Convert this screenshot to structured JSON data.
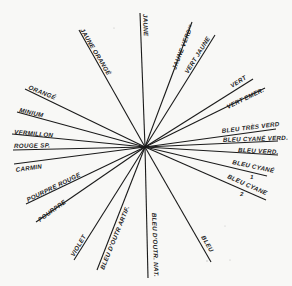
{
  "diagram": {
    "title": "",
    "center": {
      "x": 145,
      "y": 147
    },
    "rays": [
      {
        "label": "JAUNE",
        "x": 140,
        "y": 13
      },
      {
        "label": "JAUNE VERDʳᵉ",
        "x": 192,
        "y": 22
      },
      {
        "label": "VERT JAUNE",
        "x": 215,
        "y": 35
      },
      {
        "label": "VERT",
        "x": 253,
        "y": 79
      },
      {
        "label": "VERT EMER.",
        "x": 265,
        "y": 88
      },
      {
        "label": "BLEU TRÈS VERD",
        "x": 276,
        "y": 129
      },
      {
        "label": "BLEU CYANÉ VERD.",
        "x": 278,
        "y": 141
      },
      {
        "label": "BLEU VERD.",
        "x": 278,
        "y": 155
      },
      {
        "label": "BLEU CYANÉ 1",
        "x": 267,
        "y": 176
      },
      {
        "label": "BLEU CYANE 2",
        "x": 266,
        "y": 200
      },
      {
        "label": "BLEU",
        "x": 211,
        "y": 262
      },
      {
        "label": "BLEU D'OUTR. NAT.",
        "x": 148,
        "y": 278
      },
      {
        "label": "BLEU D'OUTR. ARTIF.",
        "x": 97,
        "y": 270
      },
      {
        "label": "VIOLET",
        "x": 74,
        "y": 260
      },
      {
        "label": "POURPRE",
        "x": 36,
        "y": 222
      },
      {
        "label": "POURPRE ROUGE",
        "x": 26,
        "y": 204
      },
      {
        "label": "CARMIN",
        "x": 14,
        "y": 164
      },
      {
        "label": "ROUGE SP.",
        "x": 13,
        "y": 150
      },
      {
        "label": "VERMILLON",
        "x": 12,
        "y": 134
      },
      {
        "label": "MINIUM",
        "x": 17,
        "y": 112
      },
      {
        "label": "ORANGÉ",
        "x": 25,
        "y": 89
      },
      {
        "label": "JAUNE ORANGÉ",
        "x": 79,
        "y": 30
      }
    ],
    "labels": {
      "jaune": "JAUNE",
      "jaune_verdre": "JAUNE VERDʳᵉ",
      "vert_jaune": "VERT JAUNE",
      "vert": "VERT",
      "vert_emer": "VERT EMER.",
      "bleu_tres_verd": "BLEU TRÈS VERD",
      "bleu_cyane_verd": "BLEU CYANÉ VERD.",
      "bleu_verd": "BLEU VERD.",
      "bleu_cyane_1": "BLEU CYANÉ",
      "bleu_cyane_1_num": "1",
      "bleu_cyane_2": "BLEU CYANE",
      "bleu_cyane_2_num": "2",
      "bleu": "BLEU",
      "bleu_outr_nat": "BLEU D'OUTR. NAT.",
      "bleu_outr_artif": "BLEU D'OUTR ARTIF.",
      "violet": "VIOLET",
      "pourpre": "POURPRE",
      "pourpre_rouge": "POURPRE ROUGE",
      "carmin": "CARMIN",
      "rouge_sp": "ROUGE SP.",
      "vermillon": "VERMILLON",
      "minium": "MINIUM",
      "orange": "ORANGÉ",
      "jaune_orange": "JAUNE ORANGÉ"
    }
  }
}
